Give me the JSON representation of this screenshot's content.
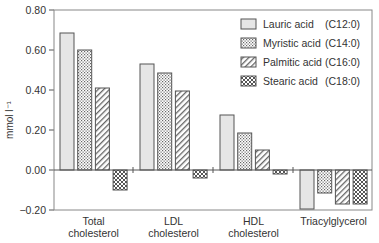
{
  "chart_data": {
    "type": "bar",
    "title": "",
    "xlabel": "",
    "ylabel": "mmol l⁻¹",
    "ylim": [
      -0.2,
      0.8
    ],
    "yticks": [
      "0.80",
      "0.60",
      "0.40",
      "0.20",
      "0.00",
      "−0.20"
    ],
    "ytick_values": [
      0.8,
      0.6,
      0.4,
      0.2,
      0.0,
      -0.2
    ],
    "grid": false,
    "legend_position": "upper right (inside plot)",
    "categories": [
      [
        "Total",
        "cholesterol"
      ],
      [
        "LDL",
        "cholesterol"
      ],
      [
        "HDL",
        "cholesterol"
      ],
      [
        "Triacylglycerol"
      ]
    ],
    "series": [
      {
        "name": "Lauric acid",
        "code": "(C12:0)",
        "pattern": "solid-light-gray",
        "values": [
          0.685,
          0.53,
          0.275,
          -0.195
        ]
      },
      {
        "name": "Myristic acid",
        "code": "(C14:0)",
        "pattern": "dotted",
        "values": [
          0.6,
          0.485,
          0.185,
          -0.115
        ]
      },
      {
        "name": "Palmitic acid",
        "code": "(C16:0)",
        "pattern": "diagonal-hatch",
        "values": [
          0.41,
          0.395,
          0.1,
          -0.17
        ]
      },
      {
        "name": "Stearic acid",
        "code": "(C18:0)",
        "pattern": "cross-hatch",
        "values": [
          -0.1,
          -0.04,
          -0.02,
          -0.17
        ]
      }
    ]
  },
  "colors": {
    "axis": "#555555",
    "bar_outline": "#555555",
    "lauric_fill": "#e6e6e6",
    "pattern_ink": "#666666"
  }
}
